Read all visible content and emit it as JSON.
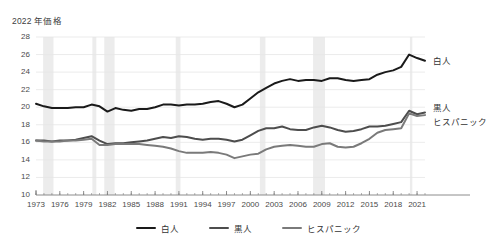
{
  "chart_data": {
    "type": "line",
    "title": "2022 年価格",
    "xlabel": "",
    "ylabel": "2022 年価格",
    "ylim": [
      10,
      28
    ],
    "ytick_step": 2,
    "yticks": [
      "28",
      "26",
      "24",
      "22",
      "20",
      "18",
      "16",
      "14",
      "12",
      "10"
    ],
    "xlim": [
      1973,
      2022
    ],
    "xticks": [
      "1973",
      "1976",
      "1979",
      "1982",
      "1985",
      "1988",
      "1991",
      "1994",
      "1997",
      "2000",
      "2003",
      "2006",
      "2009",
      "2012",
      "2015",
      "2018",
      "2021"
    ],
    "grid": "horizontal",
    "legend_position": "bottom",
    "x": [
      1973,
      1974,
      1975,
      1976,
      1977,
      1978,
      1979,
      1980,
      1981,
      1982,
      1983,
      1984,
      1985,
      1986,
      1987,
      1988,
      1989,
      1990,
      1991,
      1992,
      1993,
      1994,
      1995,
      1996,
      1997,
      1998,
      1999,
      2000,
      2001,
      2002,
      2003,
      2004,
      2005,
      2006,
      2007,
      2008,
      2009,
      2010,
      2011,
      2012,
      2013,
      2014,
      2015,
      2016,
      2017,
      2018,
      2019,
      2020,
      2021,
      2022
    ],
    "series": [
      {
        "name": "白人",
        "color": "#1a1a1a",
        "end_label": "白人",
        "values": [
          20.4,
          20.1,
          19.9,
          19.9,
          19.9,
          20.0,
          20.0,
          20.3,
          20.1,
          19.5,
          19.9,
          19.7,
          19.6,
          19.8,
          19.8,
          20.0,
          20.3,
          20.3,
          20.2,
          20.3,
          20.3,
          20.4,
          20.6,
          20.7,
          20.4,
          20.0,
          20.3,
          21.0,
          21.7,
          22.2,
          22.7,
          23.0,
          23.2,
          23.0,
          23.1,
          23.1,
          23.0,
          23.3,
          23.3,
          23.1,
          23.0,
          23.1,
          23.2,
          23.7,
          24.0,
          24.2,
          24.6,
          26.0,
          25.6,
          25.3
        ]
      },
      {
        "name": "黒人",
        "color": "#4d4d4d",
        "end_label": "黒人",
        "values": [
          16.2,
          16.2,
          16.1,
          16.2,
          16.2,
          16.3,
          16.5,
          16.7,
          16.2,
          15.8,
          15.9,
          15.9,
          16.0,
          16.1,
          16.2,
          16.4,
          16.6,
          16.5,
          16.7,
          16.6,
          16.4,
          16.3,
          16.4,
          16.4,
          16.3,
          16.1,
          16.3,
          16.8,
          17.3,
          17.6,
          17.6,
          17.8,
          17.5,
          17.4,
          17.4,
          17.7,
          17.9,
          17.7,
          17.4,
          17.2,
          17.3,
          17.5,
          17.8,
          17.8,
          17.9,
          18.1,
          18.3,
          19.6,
          19.2,
          19.4
        ]
      },
      {
        "name": "ヒスパニック",
        "color": "#7a7a7a",
        "end_label": "ヒスパニック",
        "values": [
          16.2,
          16.1,
          16.1,
          16.1,
          16.2,
          16.2,
          16.3,
          16.4,
          15.7,
          15.7,
          15.8,
          15.8,
          15.8,
          15.8,
          15.7,
          15.6,
          15.5,
          15.3,
          15.0,
          14.8,
          14.8,
          14.8,
          14.9,
          14.8,
          14.6,
          14.2,
          14.4,
          14.6,
          14.7,
          15.2,
          15.5,
          15.6,
          15.7,
          15.6,
          15.5,
          15.5,
          15.8,
          15.9,
          15.5,
          15.4,
          15.5,
          15.9,
          16.4,
          17.1,
          17.4,
          17.5,
          17.6,
          19.3,
          19.0,
          19.1
        ]
      }
    ],
    "recession_bands": [
      {
        "start": 1973.9,
        "end": 1975.2
      },
      {
        "start": 1980.1,
        "end": 1980.6
      },
      {
        "start": 1981.6,
        "end": 1982.9
      },
      {
        "start": 1990.6,
        "end": 1991.2
      },
      {
        "start": 2001.2,
        "end": 2001.9
      },
      {
        "start": 2007.9,
        "end": 2009.4
      },
      {
        "start": 2020.1,
        "end": 2020.4
      }
    ],
    "band_color": "#ececec",
    "grid_color": "#e6e6e6",
    "axis_color": "#808080"
  }
}
